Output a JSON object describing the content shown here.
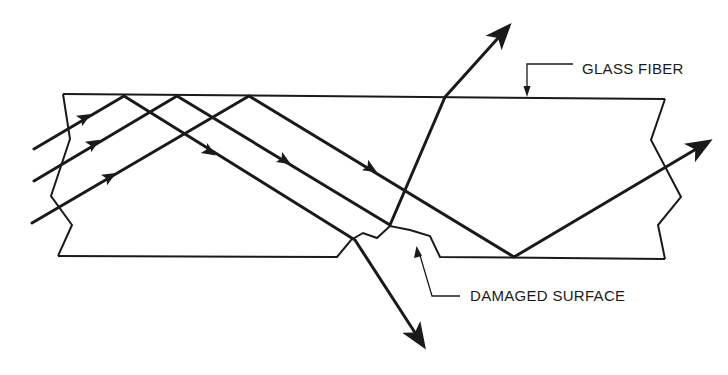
{
  "figure": {
    "labels": {
      "glass_fiber": "GLASS FIBER",
      "damaged_surface": "DAMAGED SURFACE"
    },
    "caption_partial": "…G. Results of damage to glass fiber surface",
    "colors": {
      "stroke": "#1a1a1a",
      "background": "#ffffff"
    }
  }
}
